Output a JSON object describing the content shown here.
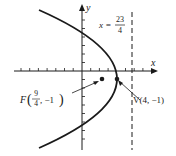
{
  "figure": {
    "type": "parabola-graph",
    "equation": "(y+1)^2 = -7(x-4)",
    "axes": {
      "x_label": "x",
      "y_label": "y"
    },
    "directrix": {
      "label_lhs": "x =",
      "label_num": "23",
      "label_den": "4",
      "value": 5.75
    },
    "focus": {
      "label_prefix": "F",
      "x_num": "9",
      "x_den": "4",
      "y_text": ", −1",
      "x": 2.25,
      "y": -1
    },
    "vertex": {
      "label": "V(4, −1)",
      "x": 4,
      "y": -1
    },
    "colors": {
      "ink": "#1a1a1a",
      "background": "#ffffff"
    }
  }
}
